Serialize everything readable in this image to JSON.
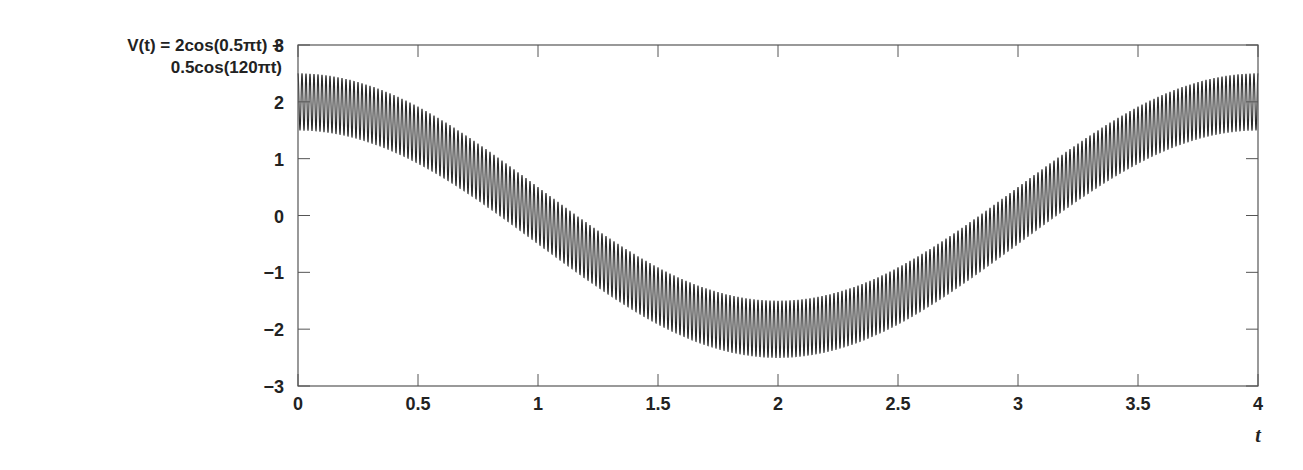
{
  "chart_data": {
    "type": "line",
    "title": "",
    "ylabel_lines": [
      "V(t) = 2cos(0.5πt) +",
      "0.5cos(120πt)"
    ],
    "xlabel": "t",
    "function": "V(t) = 2cos(0.5*pi*t) + 0.5cos(120*pi*t)",
    "xlim": [
      0,
      4
    ],
    "ylim": [
      -3,
      3
    ],
    "x_ticks": [
      0,
      0.5,
      1,
      1.5,
      2,
      2.5,
      3,
      3.5,
      4
    ],
    "x_tick_labels": [
      "0",
      "0.5",
      "1",
      "1.5",
      "2",
      "2.5",
      "3",
      "3.5",
      "4"
    ],
    "y_ticks": [
      3,
      2,
      1,
      0,
      -1,
      -2,
      -3
    ],
    "y_tick_labels": [
      "3",
      "2",
      "1",
      "0",
      "−1",
      "−2",
      "−3"
    ],
    "grid": false,
    "legend": null,
    "series": [
      {
        "name": "V(t)",
        "components": [
          {
            "amplitude": 2,
            "frequency_rad": "0.5π"
          },
          {
            "amplitude": 0.5,
            "frequency_rad": "120π"
          }
        ],
        "envelope_samples": {
          "t": [
            0,
            0.5,
            1,
            1.5,
            2,
            2.5,
            3,
            3.5,
            4
          ],
          "center": [
            2,
            1.41,
            0,
            -1.41,
            -2,
            -1.41,
            0,
            1.41,
            2
          ],
          "upper": [
            2.5,
            1.91,
            0.5,
            -0.91,
            -1.5,
            -0.91,
            0.5,
            1.91,
            2.5
          ],
          "lower": [
            1.5,
            0.91,
            -0.5,
            -1.91,
            -2.5,
            -1.91,
            -0.5,
            0.91,
            1.5
          ]
        }
      }
    ]
  },
  "colors": {
    "line": "#2a2a2a",
    "axis": "#555555",
    "text": "#222222"
  }
}
